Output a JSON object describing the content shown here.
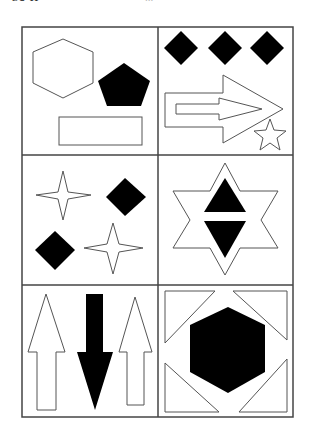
{
  "header": {
    "fragment_left": "SU-H",
    "fragment_center": "..."
  },
  "grid": {
    "rows": 3,
    "cols": 2,
    "colors": {
      "stroke": "#444444",
      "fill": "#000000",
      "background": "#ffffff"
    },
    "cells": [
      {
        "row": 1,
        "col": 1,
        "description": "outline hexagon, filled pentagon, outline rectangle"
      },
      {
        "row": 1,
        "col": 2,
        "description": "three filled diamonds, double outline arrow pointing right, small outline star"
      },
      {
        "row": 2,
        "col": 1,
        "description": "two outline four-point stars and two filled diamonds"
      },
      {
        "row": 2,
        "col": 2,
        "description": "outline six-point star containing filled up and down triangles"
      },
      {
        "row": 3,
        "col": 1,
        "description": "two outline up arrows and one filled down arrow"
      },
      {
        "row": 3,
        "col": 2,
        "description": "filled hexagon surrounded by four outline corner triangles"
      }
    ]
  }
}
